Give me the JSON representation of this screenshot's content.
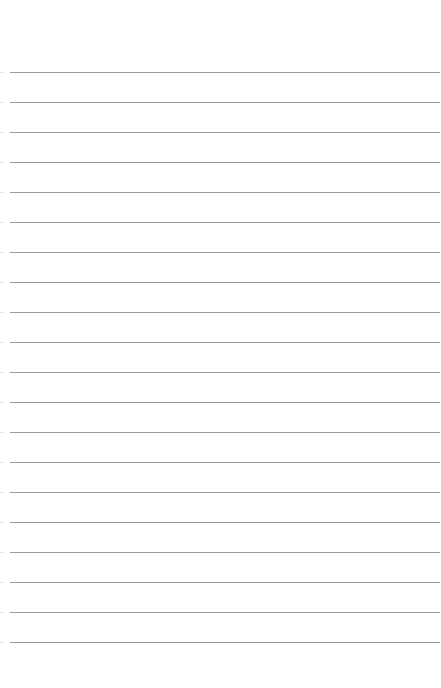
{
  "page": {
    "type": "blank lined paper",
    "background_color": "#ffffff",
    "line_color": "#9a9a9a",
    "line_count": 20,
    "first_line_y": 72,
    "line_spacing": 30
  }
}
